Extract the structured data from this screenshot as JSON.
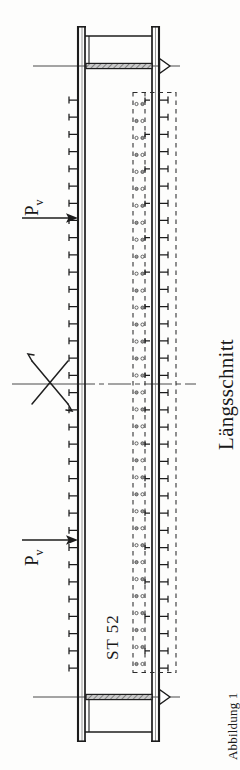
{
  "figure": {
    "title": "Längsschnitt",
    "caption": "Abbildung 1",
    "material_label": "ST 52",
    "force_symbol": "P",
    "force_subscript": "v",
    "type": "engineering-drawing",
    "view": "longitudinal-section"
  },
  "labels": {
    "section_title": "Längsschnitt",
    "caption": "Abbildung 1",
    "material": "ST 52",
    "force_top": "P",
    "force_top_sub": "v",
    "force_bottom": "P",
    "force_bottom_sub": "v"
  },
  "colors": {
    "ink": "#1a1a1a",
    "line": "#222222",
    "thin_line": "#555555",
    "hatch": "#8a8a8a",
    "background": "#fdfdfc",
    "dashed": "#333333"
  },
  "geometry": {
    "canvas_width": 240,
    "canvas_height": 770,
    "left_beam_x": 78,
    "right_beam_x": 157,
    "beam_top_y": 26,
    "beam_bottom_y": 742,
    "flange_thickness": 4,
    "top_endplate_y": 66,
    "bottom_endplate_y": 697,
    "centerline_y": 384,
    "stud_count_left": 34,
    "stud_count_right": 34,
    "bolt_hole_columns": 2,
    "dashed_box_left_x": 131,
    "dashed_box_right_x": 176,
    "dashed_box_top_y": 92,
    "dashed_box_bottom_y": 673
  },
  "annotations": {
    "reference_lines": [
      "top-support-axis",
      "center-break-axis",
      "bottom-support-axis"
    ],
    "support_markers": [
      "top-triangle-support",
      "bottom-triangle-support"
    ],
    "break_symbol": "x-break-mark",
    "load_arrows": [
      "top-load-arrow",
      "bottom-load-arrow"
    ]
  }
}
